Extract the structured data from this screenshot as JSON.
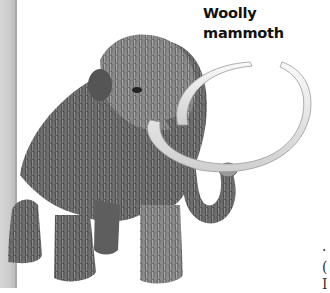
{
  "illustration": {
    "subject": "woolly-mammoth",
    "style": "grayscale pencil illustration",
    "caption_lines": [
      "Woolly",
      "mammoth"
    ]
  },
  "edge_text": {
    "lines": [
      "·",
      "(",
      "I"
    ]
  },
  "colors": {
    "background": "#ffffff",
    "fur_dark": "#4a4a4a",
    "fur_mid": "#7d7d7d",
    "fur_light": "#a8a8a8",
    "tusk": "#e8e8e8",
    "caption": "#111111"
  }
}
